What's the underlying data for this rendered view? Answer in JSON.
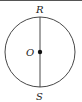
{
  "diagram": {
    "circle": {
      "cx": 40,
      "cy": 52,
      "r": 35,
      "stroke": "#333333"
    },
    "center": {
      "label": "O",
      "x": 40,
      "y": 52
    },
    "diameter": {
      "from": "R",
      "to": "S"
    },
    "points": [
      {
        "label": "R",
        "x": 40,
        "y": 17
      },
      {
        "label": "S",
        "x": 40,
        "y": 87
      }
    ]
  }
}
